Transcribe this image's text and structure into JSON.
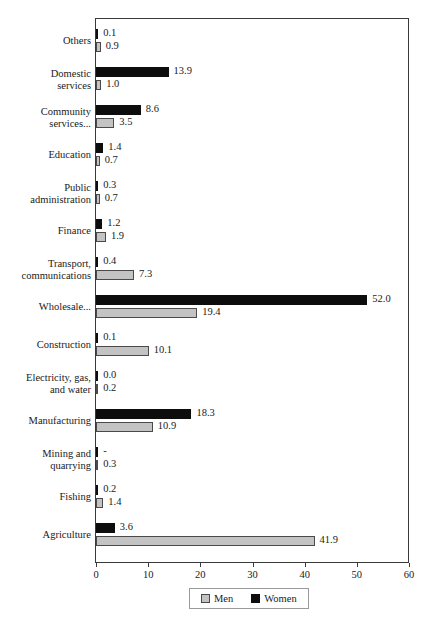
{
  "top_sliver_text": "",
  "chart_data": {
    "type": "bar",
    "orientation": "horizontal",
    "title": "",
    "subtitle": "",
    "xlabel": "",
    "ylabel": "",
    "xlim": [
      0,
      60
    ],
    "xticks": [
      0,
      10,
      20,
      30,
      40,
      50,
      60
    ],
    "xtick_labels": [
      "0",
      "10",
      "20",
      "30",
      "40",
      "50",
      "60"
    ],
    "grid": false,
    "legend_position": "bottom-center",
    "categories": [
      "Others",
      "Domestic\nservices",
      "Community\nservices...",
      "Education",
      "Public\nadministration",
      "Finance",
      "Transport,\ncommunications",
      "Wholesale...",
      "Construction",
      "Electricity, gas,\nand water",
      "Manufacturing",
      "Mining and\nquarrying",
      "Fishing",
      "Agriculture"
    ],
    "series": [
      {
        "name": "Women",
        "color": "#0d0d0d",
        "values": [
          0.1,
          13.9,
          8.6,
          1.4,
          0.3,
          1.2,
          0.4,
          52.0,
          0.1,
          0.0,
          18.3,
          0.0,
          0.2,
          3.6
        ],
        "labels": [
          "0.1",
          "13.9",
          "8.6",
          "1.4",
          "0.3",
          "1.2",
          "0.4",
          "52.0",
          "0.1",
          "0.0",
          "18.3",
          "-",
          "0.2",
          "3.6"
        ]
      },
      {
        "name": "Men",
        "color": "#c3c3c3",
        "values": [
          0.9,
          1.0,
          3.5,
          0.7,
          0.7,
          1.9,
          7.3,
          19.4,
          10.1,
          0.2,
          10.9,
          0.3,
          1.4,
          41.9
        ],
        "labels": [
          "0.9",
          "1.0",
          "3.5",
          "0.7",
          "0.7",
          "1.9",
          "7.3",
          "19.4",
          "10.1",
          "0.2",
          "10.9",
          "0.3",
          "1.4",
          "41.9"
        ]
      }
    ]
  },
  "legend": {
    "items": [
      {
        "label": "Men",
        "color": "#c3c3c3"
      },
      {
        "label": "Women",
        "color": "#0d0d0d"
      }
    ]
  }
}
